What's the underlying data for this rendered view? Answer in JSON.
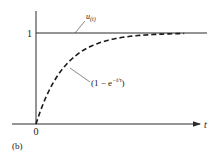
{
  "chart_data": {
    "type": "line",
    "title": "",
    "panel_label": "(b)",
    "xlabel": "t",
    "ylabel": "",
    "x_tick_labels": [
      "0"
    ],
    "y_tick_labels": [
      "1"
    ],
    "xlim": [
      0,
      6
    ],
    "ylim": [
      0,
      1.1
    ],
    "grid": false,
    "series": [
      {
        "name": "u(t)",
        "label": "u(t)",
        "style": "solid",
        "function": "step",
        "x": [
          0,
          6
        ],
        "y": [
          1,
          1
        ]
      },
      {
        "name": "1 - e^(-t/τ)",
        "label": "(1 − e^(−t/τ))",
        "style": "dashed",
        "function": "1 - exp(-t/tau)",
        "tau": 1,
        "x": [
          0,
          0.25,
          0.5,
          0.75,
          1,
          1.5,
          2,
          2.5,
          3,
          3.5,
          4,
          4.5,
          5
        ],
        "y": [
          0,
          0.221,
          0.393,
          0.528,
          0.632,
          0.777,
          0.865,
          0.918,
          0.95,
          0.97,
          0.982,
          0.989,
          0.993
        ]
      }
    ],
    "annotations": [
      {
        "text": "u",
        "subscript": "(t)",
        "target_series": "u(t)",
        "at_x": 1.3
      },
      {
        "text": "(1 − e",
        "superscript": "−t/τ",
        "suffix": ")",
        "target_series": "1 - e^(-t/τ)",
        "at_x": 1.05
      }
    ]
  }
}
